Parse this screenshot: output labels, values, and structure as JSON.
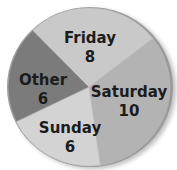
{
  "chart_data": {
    "type": "pie",
    "title": "",
    "categories": [
      "Friday",
      "Saturday",
      "Sunday",
      "Other"
    ],
    "values": [
      8,
      10,
      6,
      6
    ],
    "total": 30,
    "colors": [
      "#c9c9c9",
      "#b3b3b3",
      "#d3d3d3",
      "#7b7b7b"
    ],
    "legend": "none (labels inside slices)"
  },
  "slices": [
    {
      "label": "Friday",
      "value": "8"
    },
    {
      "label": "Saturday",
      "value": "10"
    },
    {
      "label": "Sunday",
      "value": "6"
    },
    {
      "label": "Other",
      "value": "6"
    }
  ]
}
